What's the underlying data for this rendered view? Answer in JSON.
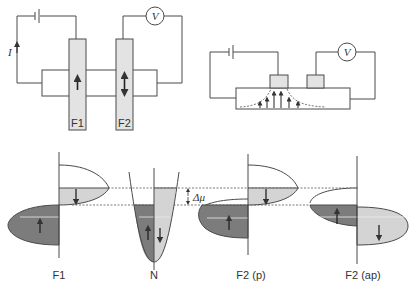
{
  "colors": {
    "line": "#4a4a4a",
    "light_fill": "#d4d4d4",
    "dark_fill": "#7c7c7c",
    "electrode_fill": "#e3e3e3",
    "dashed": "#555555"
  },
  "circuit_left": {
    "current_label": "I",
    "voltmeter_label": "V",
    "electrodes": [
      {
        "label": "F1",
        "magnetization": "up"
      },
      {
        "label": "F2",
        "magnetization": "up-down"
      }
    ]
  },
  "circuit_right": {
    "voltmeter_label": "V",
    "description": "spin injection with diffusing spin current arrows"
  },
  "dos_panels": [
    {
      "label": "F1",
      "minority_arrow": "down",
      "majority_arrow": "up"
    },
    {
      "label": "N",
      "left_arrow": "up",
      "right_arrow": "down"
    },
    {
      "label": "F2 (p)",
      "minority_arrow": "down",
      "majority_arrow": "up"
    },
    {
      "label": "F2 (ap)",
      "left_arrow": "up",
      "right_arrow": "down"
    }
  ],
  "delta_mu_label": "Δμ"
}
